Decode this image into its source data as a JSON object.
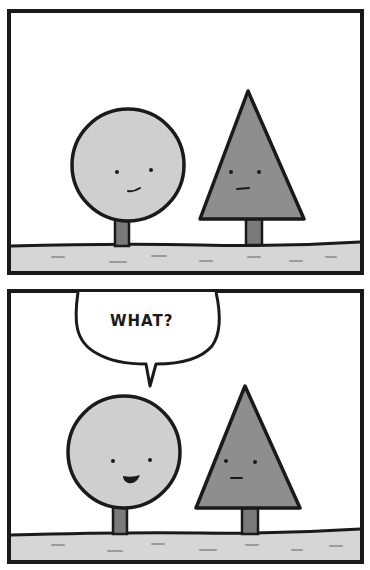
{
  "comic": {
    "panels": [
      {
        "index": 1,
        "characters": [
          {
            "name": "round-tree",
            "expression": "smile"
          },
          {
            "name": "triangle-tree",
            "expression": "neutral-smile"
          }
        ]
      },
      {
        "index": 2,
        "speech": {
          "speaker": "round-tree",
          "text": "WHAT?"
        },
        "characters": [
          {
            "name": "round-tree",
            "expression": "open-mouth-grin"
          },
          {
            "name": "triangle-tree",
            "expression": "neutral"
          }
        ]
      }
    ]
  },
  "colors": {
    "ink": "#1a1a1a",
    "background": "#ffffff",
    "round_tree": "#cfcfcf",
    "triangle_tree": "#8e8e8e",
    "trunk": "#7a7a7a",
    "ground": "#d6d6d6",
    "ground_dash": "#9a9a9a"
  }
}
